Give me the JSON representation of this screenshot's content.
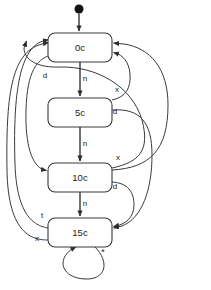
{
  "diagram": {
    "type": "state-machine",
    "canvas": {
      "width": 211,
      "height": 290
    },
    "colors": {
      "background": "#ffffff",
      "stroke": "#3a3a3a",
      "text": "#1a1a1a",
      "start_dot": "#111111"
    },
    "start": {
      "name": "initial-state-marker",
      "cx": 79,
      "cy": 9,
      "r": 4.5,
      "target": "0c"
    },
    "states": [
      {
        "id": "s0",
        "label": "0c",
        "x": 48,
        "y": 33,
        "w": 64,
        "h": 29,
        "rx": 7
      },
      {
        "id": "s5",
        "label": "5c",
        "x": 48,
        "y": 98,
        "w": 64,
        "h": 29,
        "rx": 7
      },
      {
        "id": "s10",
        "label": "10c",
        "x": 48,
        "y": 163,
        "w": 64,
        "h": 29,
        "rx": 7
      },
      {
        "id": "s15",
        "label": "15c",
        "x": 48,
        "y": 218,
        "w": 64,
        "h": 29,
        "rx": 7
      }
    ],
    "transition_labels": [
      {
        "id": "t-n1",
        "text": "n",
        "x": 85,
        "y": 79
      },
      {
        "id": "t-n2",
        "text": "n",
        "x": 85,
        "y": 144
      },
      {
        "id": "t-n3",
        "text": "n",
        "x": 85,
        "y": 204
      },
      {
        "id": "t-d-0c",
        "text": "d",
        "x": 45,
        "y": 76
      },
      {
        "id": "t-x-5c",
        "text": "x",
        "x": 117,
        "y": 90
      },
      {
        "id": "t-d-5c",
        "text": "d",
        "x": 115,
        "y": 112
      },
      {
        "id": "t-x-10c",
        "text": "x",
        "x": 118,
        "y": 158
      },
      {
        "id": "t-d-10c",
        "text": "d",
        "x": 115,
        "y": 187
      },
      {
        "id": "t-t-15c",
        "text": "t",
        "x": 42,
        "y": 216
      },
      {
        "id": "t-x-15c",
        "text": "x",
        "x": 37,
        "y": 239
      },
      {
        "id": "t-star",
        "text": "*",
        "x": 103,
        "y": 253
      }
    ],
    "transitions": [
      {
        "from": "start",
        "to": "0c",
        "label": ""
      },
      {
        "from": "0c",
        "to": "5c",
        "label": "n"
      },
      {
        "from": "5c",
        "to": "10c",
        "label": "n"
      },
      {
        "from": "10c",
        "to": "15c",
        "label": "n"
      },
      {
        "from": "0c",
        "to": "10c",
        "label": "d"
      },
      {
        "from": "5c",
        "to": "0c",
        "label": "x"
      },
      {
        "from": "5c",
        "to": "15c",
        "label": "d"
      },
      {
        "from": "10c",
        "to": "0c",
        "label": "x"
      },
      {
        "from": "10c",
        "to": "15c",
        "label": "d"
      },
      {
        "from": "15c",
        "to": "0c",
        "label": "t"
      },
      {
        "from": "15c",
        "to": "0c",
        "label": "x"
      },
      {
        "from": "15c",
        "to": "15c",
        "label": "*"
      }
    ]
  }
}
